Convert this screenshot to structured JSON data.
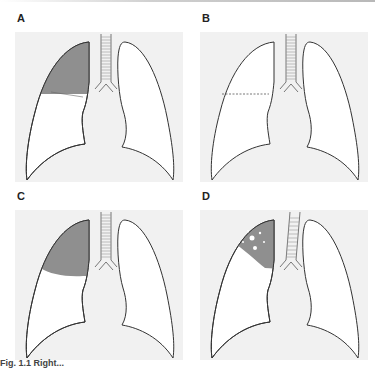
{
  "figure": {
    "panels": [
      {
        "id": "A",
        "label": "A",
        "description": "Right upper lobe opacity with horizontal lower border (fissure)",
        "finding": "upper-lobe-consolidation"
      },
      {
        "id": "B",
        "label": "B",
        "description": "Normal lungs with horizontal fissure shown as dashed line",
        "finding": "horizontal-fissure"
      },
      {
        "id": "C",
        "label": "C",
        "description": "Right upper lobe opacity with convex lower border",
        "finding": "upper-lobe-mass-bulging"
      },
      {
        "id": "D",
        "label": "D",
        "description": "Right upper lobe apical opacity with small lucencies (cavities)",
        "finding": "apical-cavitating-lesion"
      }
    ],
    "caption": "Fig. 1.1 Right..."
  },
  "colors": {
    "panel_background": "#f1f1f1",
    "lung_fill": "#ffffff",
    "lung_outline": "#333333",
    "opacity_fill": "#8f8f8f"
  }
}
